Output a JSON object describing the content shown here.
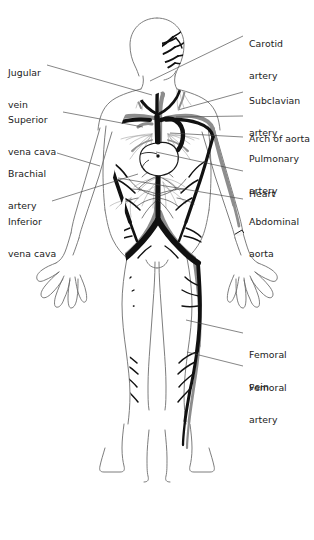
{
  "figure": {
    "background_color": "#ffffff",
    "artery_color": "#8d8d8d",
    "vein_color": "#111111",
    "outline_color": "#6e6e6e",
    "leader_color": "#444444",
    "text_color": "#1a1a1a"
  },
  "labels_left": [
    {
      "id": "jugular-vein",
      "line1": "Jugular",
      "line2": "vein",
      "x": 8,
      "y": 47,
      "leader": {
        "x1": 47,
        "y1": 65,
        "x2": 152,
        "y2": 95
      }
    },
    {
      "id": "superior-vena-cava",
      "line1": "Superior",
      "line2": "vena cava",
      "x": 8,
      "y": 94,
      "leader": {
        "x1": 63,
        "y1": 112,
        "x2": 143,
        "y2": 127
      }
    },
    {
      "id": "brachial-artery",
      "line1": "Brachial",
      "line2": "artery",
      "x": 8,
      "y": 148,
      "leader": {
        "x1": 57,
        "y1": 153,
        "x2": 100,
        "y2": 166
      }
    },
    {
      "id": "inferior-vena-cava",
      "line1": "Inferior",
      "line2": "vena cava",
      "x": 8,
      "y": 196,
      "leader": {
        "x1": 52,
        "y1": 201,
        "x2": 138,
        "y2": 174
      }
    }
  ],
  "labels_right": [
    {
      "id": "carotid-artery",
      "line1": "Carotid",
      "line2": "artery",
      "x": 249,
      "y": 18,
      "leader": {
        "x1": 243,
        "y1": 36,
        "x2": 150,
        "y2": 81
      }
    },
    {
      "id": "subclavian-artery",
      "line1": "Subclavian",
      "line2": "artery",
      "x": 249,
      "y": 75,
      "leader": {
        "x1": 243,
        "y1": 92,
        "x2": 178,
        "y2": 110
      }
    },
    {
      "id": "arch-of-aorta",
      "line1": "Arch of aorta",
      "line2": "",
      "x": 249,
      "y": 113,
      "leader": {
        "x1": 243,
        "y1": 116,
        "x2": 176,
        "y2": 117
      }
    },
    {
      "id": "pulmonary-artery",
      "line1": "Pulmonary",
      "line2": "artery",
      "x": 249,
      "y": 133,
      "leader": {
        "x1": 243,
        "y1": 137,
        "x2": 170,
        "y2": 133
      }
    },
    {
      "id": "heart",
      "line1": "Heart",
      "line2": "",
      "x": 249,
      "y": 168,
      "leader": {
        "x1": 243,
        "y1": 171,
        "x2": 156,
        "y2": 152
      }
    },
    {
      "id": "abdominal-aorta",
      "line1": "Abdominal",
      "line2": "aorta",
      "x": 249,
      "y": 196,
      "leader": {
        "x1": 243,
        "y1": 199,
        "x2": 118,
        "y2": 178
      }
    },
    {
      "id": "femoral-vein",
      "line1": "Femoral",
      "line2": "vein",
      "x": 249,
      "y": 329,
      "leader": {
        "x1": 243,
        "y1": 333,
        "x2": 186,
        "y2": 320
      }
    },
    {
      "id": "femoral-artery",
      "line1": "Femoral",
      "line2": "artery",
      "x": 249,
      "y": 362,
      "leader": {
        "x1": 243,
        "y1": 366,
        "x2": 187,
        "y2": 352
      }
    }
  ],
  "legend_notes": {
    "arteries": "gray vessels",
    "veins": "black vessels"
  }
}
